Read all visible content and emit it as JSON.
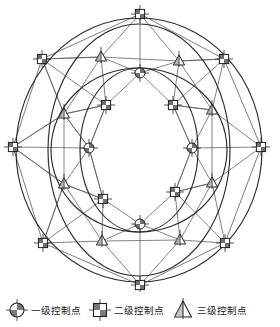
{
  "figure": {
    "type": "control-network-diagram",
    "colors": {
      "background": "#ffffff",
      "line": "#4a4a4a",
      "curve": "#2b2b2b",
      "marker_stroke": "#1f1f1f",
      "marker_fill_dark": "#6b6b6b",
      "marker_fill_light": "#ffffff",
      "text": "#1a1a1a"
    }
  },
  "legend": {
    "items": [
      {
        "icon": "quartered-circle-cross-icon",
        "label": "一级控制点",
        "level": 1
      },
      {
        "icon": "quartered-square-cross-icon",
        "label": "二级控制点",
        "level": 2
      },
      {
        "icon": "triangle-with-vertical-line-icon",
        "label": "三级控制点",
        "level": 3
      }
    ]
  },
  "network": {
    "nodes": [
      {
        "id": "o1",
        "label": "",
        "type": "square",
        "x": 140,
        "y": 14
      },
      {
        "id": "o2",
        "label": "",
        "type": "square",
        "x": 224,
        "y": 59
      },
      {
        "id": "o3",
        "label": "",
        "type": "square",
        "x": 261,
        "y": 147
      },
      {
        "id": "o4",
        "label": "",
        "type": "square",
        "x": 225,
        "y": 243
      },
      {
        "id": "o5",
        "label": "",
        "type": "square",
        "x": 140,
        "y": 285
      },
      {
        "id": "o6",
        "label": "",
        "type": "square",
        "x": 43,
        "y": 243
      },
      {
        "id": "o7",
        "label": "",
        "type": "square",
        "x": 13,
        "y": 147
      },
      {
        "id": "o8",
        "label": "",
        "type": "square",
        "x": 42,
        "y": 59
      },
      {
        "id": "m1",
        "label": "",
        "type": "triangle",
        "x": 101,
        "y": 57
      },
      {
        "id": "m2",
        "label": "",
        "type": "triangle",
        "x": 179,
        "y": 61
      },
      {
        "id": "m3",
        "label": "",
        "type": "triangle",
        "x": 212,
        "y": 110
      },
      {
        "id": "m4",
        "label": "",
        "type": "triangle",
        "x": 212,
        "y": 183
      },
      {
        "id": "m5",
        "label": "",
        "type": "triangle",
        "x": 180,
        "y": 240
      },
      {
        "id": "m6",
        "label": "",
        "type": "triangle",
        "x": 102,
        "y": 241
      },
      {
        "id": "m7",
        "label": "",
        "type": "triangle",
        "x": 64,
        "y": 184
      },
      {
        "id": "m8",
        "label": "",
        "type": "triangle",
        "x": 64,
        "y": 114
      },
      {
        "id": "i1",
        "label": "",
        "type": "circle",
        "x": 140,
        "y": 73
      },
      {
        "id": "i2",
        "label": "",
        "type": "square",
        "x": 173,
        "y": 105
      },
      {
        "id": "i3",
        "label": "",
        "type": "circle",
        "x": 192,
        "y": 148
      },
      {
        "id": "i4",
        "label": "",
        "type": "square",
        "x": 175,
        "y": 192
      },
      {
        "id": "i5",
        "label": "",
        "type": "circle",
        "x": 140,
        "y": 224
      },
      {
        "id": "i6",
        "label": "",
        "type": "square",
        "x": 103,
        "y": 199
      },
      {
        "id": "i7",
        "label": "",
        "type": "circle",
        "x": 89,
        "y": 148
      },
      {
        "id": "i8",
        "label": "",
        "type": "square",
        "x": 106,
        "y": 105
      }
    ],
    "edge_count": 56,
    "ring_labels": [
      "outer-octagon",
      "outer-ellipse",
      "inner-ellipse"
    ]
  }
}
